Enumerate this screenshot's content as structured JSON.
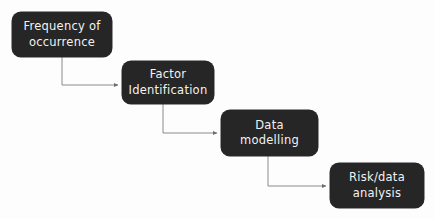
{
  "diagram": {
    "type": "flowchart",
    "canvas": {
      "width": 434,
      "height": 219,
      "background_color": "#fdfdfd"
    },
    "style": {
      "node_fill": "#262626",
      "node_text_color": "#f2f2f2",
      "connector_color": "#8a8a8a",
      "corner_radius": 9
    },
    "nodes": [
      {
        "id": "frequency",
        "label": "Frequency of\noccurrence",
        "line1": "Frequency of",
        "line2": "occurrence",
        "order": 1
      },
      {
        "id": "factor",
        "label": "Factor\nIdentification",
        "line1": "Factor",
        "line2": "Identification",
        "order": 2
      },
      {
        "id": "modelling",
        "label": "Data\nmodelling",
        "line1": "Data",
        "line2": "modelling",
        "order": 3
      },
      {
        "id": "risk",
        "label": "Risk/data\nanalysis",
        "line1": "Risk/data",
        "line2": "analysis",
        "order": 4
      }
    ],
    "connectors": [
      {
        "id": "c1",
        "from": "frequency",
        "to": "factor",
        "style": "elbow-down-right",
        "arrow": "arrowhead-icon"
      },
      {
        "id": "c2",
        "from": "factor",
        "to": "modelling",
        "style": "elbow-down-right",
        "arrow": "arrowhead-icon"
      },
      {
        "id": "c3",
        "from": "modelling",
        "to": "risk",
        "style": "elbow-down-right",
        "arrow": "arrowhead-icon"
      }
    ]
  }
}
